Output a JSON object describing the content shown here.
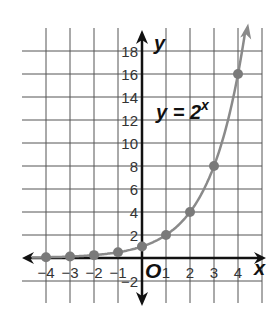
{
  "chart_data": {
    "type": "line",
    "title": "",
    "equation": "y = 2",
    "equation_exponent": "x",
    "xlabel": "x",
    "ylabel": "y",
    "origin_label": "O",
    "xlim": [
      -4,
      4
    ],
    "ylim": [
      -2,
      18
    ],
    "grid": true,
    "x_ticks": [
      "−4",
      "−3",
      "−2",
      "−1",
      "1",
      "2",
      "3",
      "4"
    ],
    "x_tick_values": [
      -4,
      -3,
      -2,
      -1,
      1,
      2,
      3,
      4
    ],
    "y_ticks": [
      "18",
      "16",
      "14",
      "12",
      "10",
      "8",
      "6",
      "4",
      "2",
      "−2"
    ],
    "y_tick_values": [
      18,
      16,
      14,
      12,
      10,
      8,
      6,
      4,
      2,
      -2
    ],
    "series": [
      {
        "name": "y = 2^x",
        "x": [
          -4,
          -3,
          -2,
          -1,
          0,
          1,
          2,
          3,
          4
        ],
        "values": [
          0.0625,
          0.125,
          0.25,
          0.5,
          1,
          2,
          4,
          8,
          16
        ],
        "color": "#808080"
      }
    ]
  }
}
